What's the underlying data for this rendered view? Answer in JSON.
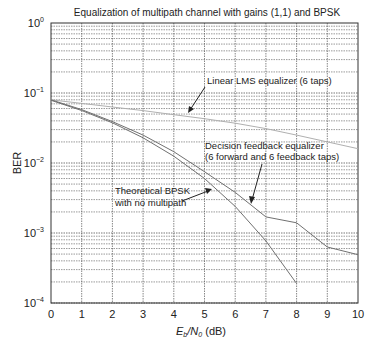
{
  "chart_data": {
    "type": "line",
    "title": "Equalization of multipath channel with gains (1,1) and BPSK",
    "xlabel": "E_b/N_0 (dB)",
    "ylabel": "BER",
    "xlim": [
      0,
      10
    ],
    "ylim": [
      0.0001,
      1
    ],
    "yscale": "log",
    "grid": true,
    "x_ticks": [
      0,
      1,
      2,
      3,
      4,
      5,
      6,
      7,
      8,
      9,
      10
    ],
    "y_ticks": [
      "10^0",
      "10^-1",
      "10^-2",
      "10^-3",
      "10^-4"
    ],
    "series": [
      {
        "name": "Linear LMS equalizer (6 taps)",
        "color": "#b0b0b0",
        "x": [
          0,
          1,
          2,
          3,
          4,
          5,
          6,
          7,
          8,
          9,
          10
        ],
        "values": [
          0.08,
          0.071,
          0.063,
          0.056,
          0.049,
          0.043,
          0.037,
          0.031,
          0.025,
          0.02,
          0.016
        ]
      },
      {
        "name": "Decision feedback equalizer (6 forward and 6 feedback taps)",
        "color": "#707070",
        "x": [
          0,
          1,
          2,
          3,
          4,
          5,
          6,
          7,
          8,
          9,
          10
        ],
        "values": [
          0.08,
          0.058,
          0.039,
          0.025,
          0.0145,
          0.0075,
          0.0038,
          0.0017,
          0.0014,
          0.00063,
          0.00049
        ]
      },
      {
        "name": "Theoretical BPSK with no multipath",
        "color": "#707070",
        "x": [
          0,
          1,
          2,
          3,
          4,
          5,
          6,
          7,
          8
        ],
        "values": [
          0.0786,
          0.0563,
          0.0375,
          0.0229,
          0.0125,
          0.006,
          0.0024,
          0.00077,
          0.00019
        ]
      }
    ],
    "annotations": [
      {
        "text": "Linear LMS equalizer (6 taps)",
        "points_to": "Linear LMS equalizer (6 taps)"
      },
      {
        "text": "Decision feedback equalizer",
        "text2": "(6 forward and 6 feedback taps)",
        "points_to": "Decision feedback equalizer"
      },
      {
        "text": "Theoretical BPSK",
        "text2": "with no multipath",
        "points_to": "Theoretical BPSK with no multipath"
      }
    ]
  },
  "labels": {
    "title": "Equalization of multipath channel with gains (1,1) and BPSK",
    "ylabel": "BER",
    "xlabel_main": "E",
    "xlabel_sub_b": "b",
    "xlabel_slash": "/N",
    "xlabel_sub_0": "0",
    "xlabel_unit": " (dB)",
    "ytick_base": "10",
    "ytick_exps": [
      "0",
      "−1",
      "−2",
      "−3",
      "−4"
    ],
    "xticks": [
      "0",
      "1",
      "2",
      "3",
      "4",
      "5",
      "6",
      "7",
      "8",
      "9",
      "10"
    ],
    "annot_lms": "Linear LMS equalizer (6 taps)",
    "annot_dfe_1": "Decision feedback equalizer",
    "annot_dfe_2": "(6 forward and 6 feedback taps)",
    "annot_bpsk_1": "Theoretical BPSK",
    "annot_bpsk_2": "with no multipath"
  }
}
